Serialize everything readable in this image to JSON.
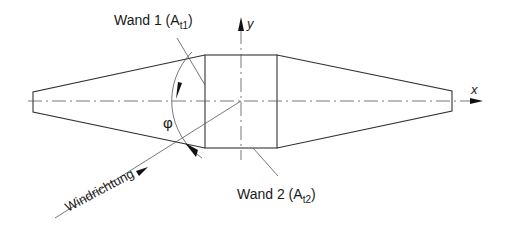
{
  "labels": {
    "wall1": "Wand 1 (A",
    "wall1_sub": "t1",
    "wall1_close": ")",
    "wall2": "Wand 2 (A",
    "wall2_sub": "t2",
    "wall2_close": ")",
    "wind": "Windrichtung",
    "angle": "φ",
    "x_axis": "x",
    "y_axis": "y"
  },
  "colors": {
    "line": "#333333",
    "text": "#1a1a1a"
  }
}
